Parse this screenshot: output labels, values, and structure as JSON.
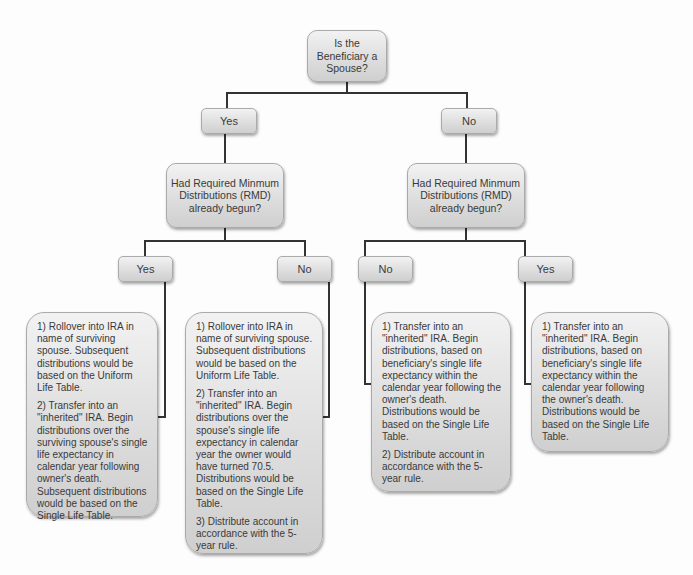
{
  "diagram": {
    "root": {
      "label": "Is the Beneficiary a Spouse?"
    },
    "branches": [
      {
        "label": "Yes",
        "question": "Had Required Minmum Distributions (RMD) already begun?",
        "children": [
          {
            "label": "Yes",
            "outcome": [
              "1) Rollover into IRA in name of surviving spouse. Subsequent distributions would be based on the Uniform Life Table.",
              "2) Transfer into an \"inherited\" IRA. Begin distributions over the surviving spouse's single life expectancy in calendar year following owner's death. Subsequent distributions would be based on the Single Life Table."
            ]
          },
          {
            "label": "No",
            "outcome": [
              "1) Rollover into IRA in name of surviving spouse. Subsequent distributions would be based on the Uniform Life Table.",
              "2) Transfer into an \"inherited\" IRA. Begin distributions over the spouse's single life expectancy in calendar year the owner would have turned 70.5. Distributions would be based on the Single Life Table.",
              "3) Distribute account in accordance with the 5-year rule."
            ]
          }
        ]
      },
      {
        "label": "No",
        "question": "Had Required Minmum Distributions (RMD) already begun?",
        "children": [
          {
            "label": "No",
            "outcome": [
              "1) Transfer into an \"inherited\" IRA. Begin distributions, based on beneficiary's single life expectancy within the calendar year following the owner's death. Distributions would be based on the Single Life Table.",
              "2) Distribute account in accordance with the 5-year rule."
            ]
          },
          {
            "label": "Yes",
            "outcome": [
              "1) Transfer into an \"inherited\" IRA. Begin distributions, based on beneficiary's single life expectancy within the calendar year following the owner's death. Distributions would be based on the Single Life Table."
            ]
          }
        ]
      }
    ]
  }
}
